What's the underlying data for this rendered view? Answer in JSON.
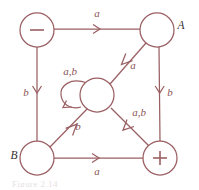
{
  "figure": {
    "type": "state-transition-diagram",
    "caption_fragment": "Figure 2.14",
    "stroke_color": "#9a5f62",
    "label_color": "#8d5457",
    "node_label_color": "#333035",
    "background": "#ffffff"
  },
  "nodes": [
    {
      "id": "minus",
      "label": "−",
      "label_kind": "glyph",
      "outside_label": "",
      "cx": 37,
      "cy": 30,
      "r": 17
    },
    {
      "id": "A",
      "label": "",
      "label_kind": "none",
      "outside_label": "A",
      "cx": 157,
      "cy": 30,
      "r": 17
    },
    {
      "id": "center",
      "label": "",
      "label_kind": "none",
      "outside_label": "",
      "cx": 97,
      "cy": 95,
      "r": 17
    },
    {
      "id": "B",
      "label": "",
      "label_kind": "none",
      "outside_label": "B",
      "cx": 37,
      "cy": 158,
      "r": 17
    },
    {
      "id": "plus",
      "label": "+",
      "label_kind": "glyph",
      "outside_label": "",
      "cx": 160,
      "cy": 158,
      "r": 17
    }
  ],
  "edges": [
    {
      "id": "minus-to-A",
      "from": "minus",
      "to": "A",
      "label": "a",
      "label_x": 97,
      "label_y": 14
    },
    {
      "id": "minus-to-B",
      "from": "minus",
      "to": "B",
      "label": "b",
      "label_x": 26,
      "label_y": 93
    },
    {
      "id": "A-to-center",
      "from": "A",
      "to": "center",
      "label": "a",
      "label_x": 133,
      "label_y": 66
    },
    {
      "id": "A-to-plus",
      "from": "A",
      "to": "plus",
      "label": "b",
      "label_x": 170,
      "label_y": 93
    },
    {
      "id": "B-to-center",
      "from": "B",
      "to": "center",
      "label": "b",
      "label_x": 78,
      "label_y": 127
    },
    {
      "id": "B-to-plus",
      "from": "B",
      "to": "plus",
      "label": "a",
      "label_x": 97,
      "label_y": 172
    },
    {
      "id": "plus-to-center",
      "from": "plus",
      "to": "center",
      "label": "a,b",
      "label_x": 139,
      "label_y": 113
    },
    {
      "id": "center-self-loop",
      "from": "center",
      "to": "center",
      "label": "a,b",
      "label_x": 70,
      "label_y": 72
    }
  ]
}
